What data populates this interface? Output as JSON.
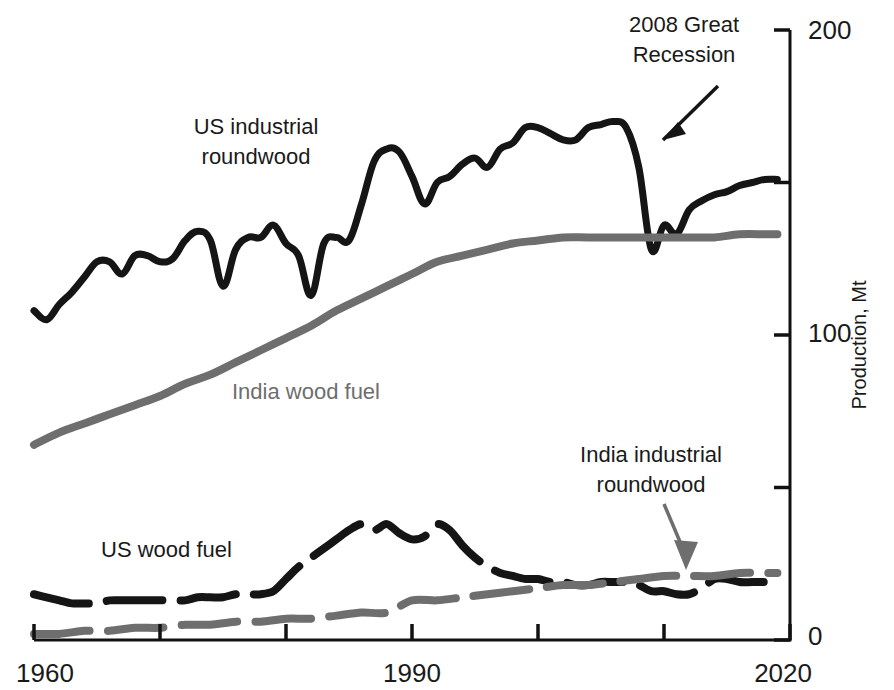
{
  "figure": {
    "background": "#ffffff",
    "width": 894,
    "height": 690
  },
  "colors": {
    "black_series": "#151515",
    "gray_series": "#6e6e6e",
    "axis": "#111111",
    "text": "#1a1a1a",
    "gray_text": "#6e6e6e"
  },
  "chart_data": {
    "type": "line",
    "title": "",
    "subtitle": "",
    "xlabel": "",
    "ylabel": "Production, Mt",
    "xlim": [
      1960,
      2020
    ],
    "ylim": [
      0,
      200
    ],
    "xticks": [
      1960,
      1970,
      1980,
      1990,
      2000,
      2010,
      2020
    ],
    "xtick_labels": [
      "1960",
      "",
      "",
      "1990",
      "",
      "",
      "2020"
    ],
    "yticks": [
      0,
      50,
      100,
      150,
      200
    ],
    "ytick_labels": [
      "0",
      "",
      "100",
      "",
      "200"
    ],
    "grid": false,
    "legend": "inline-labels",
    "y_axis_position": "right",
    "annotations": [
      {
        "name": "recession-annotation",
        "text_line1": "2008 Great",
        "text_line2": "Recession",
        "color": "#1a1a1a",
        "target_year": 2008,
        "target_value": 152
      },
      {
        "name": "india-industrial-annotation",
        "text_line1": "India industrial",
        "text_line2": "roundwood",
        "color": "#6e6e6e",
        "target_year": 2010,
        "target_value": 22
      }
    ],
    "series": [
      {
        "name": "US industrial roundwood",
        "label": "US industrial roundwood",
        "label_line1": "US industrial",
        "label_line2": "roundwood",
        "color": "#151515",
        "style": "solid",
        "width": 7,
        "x": [
          1960,
          1961,
          1962,
          1963,
          1964,
          1965,
          1966,
          1967,
          1968,
          1969,
          1970,
          1971,
          1972,
          1973,
          1974,
          1975,
          1976,
          1977,
          1978,
          1979,
          1980,
          1981,
          1982,
          1983,
          1984,
          1985,
          1986,
          1987,
          1988,
          1989,
          1990,
          1991,
          1992,
          1993,
          1994,
          1995,
          1996,
          1997,
          1998,
          1999,
          2000,
          2001,
          2002,
          2003,
          2004,
          2005,
          2006,
          2007,
          2008,
          2009,
          2010,
          2011,
          2012,
          2013,
          2014,
          2015,
          2016,
          2017,
          2018,
          2019
        ],
        "y": [
          108,
          105,
          110,
          114,
          119,
          124,
          124,
          120,
          126,
          126,
          124,
          125,
          131,
          134,
          131,
          116,
          128,
          132,
          132,
          136,
          130,
          126,
          113,
          130,
          132,
          131,
          143,
          157,
          161,
          160,
          152,
          143,
          150,
          152,
          156,
          158,
          155,
          161,
          163,
          168,
          168,
          166,
          164,
          164,
          168,
          169,
          170,
          168,
          155,
          128,
          136,
          133,
          141,
          144,
          146,
          147,
          149,
          150,
          151,
          151
        ]
      },
      {
        "name": "India wood fuel",
        "label": "India wood fuel",
        "color": "#6e6e6e",
        "style": "solid",
        "width": 8,
        "x": [
          1960,
          1962,
          1964,
          1966,
          1968,
          1970,
          1972,
          1974,
          1976,
          1978,
          1980,
          1982,
          1984,
          1986,
          1988,
          1990,
          1992,
          1994,
          1996,
          1998,
          2000,
          2002,
          2004,
          2006,
          2008,
          2010,
          2012,
          2014,
          2016,
          2018,
          2019
        ],
        "y": [
          64,
          68,
          71,
          74,
          77,
          80,
          84,
          87,
          91,
          95,
          99,
          103,
          108,
          112,
          116,
          120,
          124,
          126,
          128,
          130,
          131,
          132,
          132,
          132,
          132,
          132,
          132,
          132,
          133,
          133,
          133
        ]
      },
      {
        "name": "US wood fuel",
        "label": "US wood fuel",
        "color": "#151515",
        "style": "dashed",
        "width": 8,
        "x": [
          1960,
          1961,
          1962,
          1963,
          1964,
          1965,
          1966,
          1967,
          1968,
          1969,
          1970,
          1971,
          1972,
          1973,
          1974,
          1975,
          1976,
          1977,
          1978,
          1979,
          1980,
          1981,
          1982,
          1983,
          1984,
          1985,
          1986,
          1987,
          1988,
          1989,
          1990,
          1991,
          1992,
          1993,
          1994,
          1995,
          1996,
          1997,
          1998,
          1999,
          2000,
          2001,
          2002,
          2003,
          2004,
          2005,
          2006,
          2007,
          2008,
          2009,
          2010,
          2011,
          2012,
          2013,
          2014,
          2015,
          2016,
          2017,
          2018,
          2019
        ],
        "y": [
          15,
          14,
          13,
          12,
          12,
          12,
          13,
          13,
          13,
          13,
          13,
          13,
          13,
          14,
          14,
          14,
          15,
          15,
          15,
          16,
          20,
          24,
          27,
          30,
          33,
          36,
          38,
          36,
          38,
          35,
          33,
          34,
          38,
          36,
          31,
          27,
          24,
          22,
          21,
          20,
          20,
          19,
          19,
          18,
          18,
          19,
          19,
          19,
          18,
          16,
          16,
          15,
          15,
          17,
          20,
          20,
          19,
          19,
          19,
          19
        ]
      },
      {
        "name": "India industrial roundwood",
        "label": "India industrial roundwood",
        "color": "#6e6e6e",
        "style": "dashed",
        "width": 8,
        "x": [
          1960,
          1962,
          1964,
          1966,
          1968,
          1970,
          1972,
          1974,
          1976,
          1978,
          1980,
          1982,
          1984,
          1986,
          1988,
          1990,
          1992,
          1994,
          1996,
          1998,
          2000,
          2002,
          2004,
          2006,
          2008,
          2010,
          2012,
          2014,
          2016,
          2018,
          2019
        ],
        "y": [
          2,
          2,
          3,
          3,
          4,
          4,
          5,
          5,
          6,
          6,
          7,
          7,
          8,
          9,
          9,
          13,
          13,
          14,
          15,
          16,
          17,
          18,
          18,
          19,
          20,
          21,
          21,
          21,
          22,
          22,
          22
        ]
      }
    ]
  },
  "labels": {
    "us_industrial_line1": "US industrial",
    "us_industrial_line2": "roundwood",
    "india_wood_fuel": "India wood fuel",
    "us_wood_fuel": "US wood fuel",
    "recession_line1": "2008 Great",
    "recession_line2": "Recession",
    "india_industrial_line1": "India industrial",
    "india_industrial_line2": "roundwood",
    "y_axis_title": "Production, Mt",
    "x_1960": "1960",
    "x_1990": "1990",
    "x_2020": "2020",
    "y_0": "0",
    "y_100": "100",
    "y_200": "200"
  }
}
